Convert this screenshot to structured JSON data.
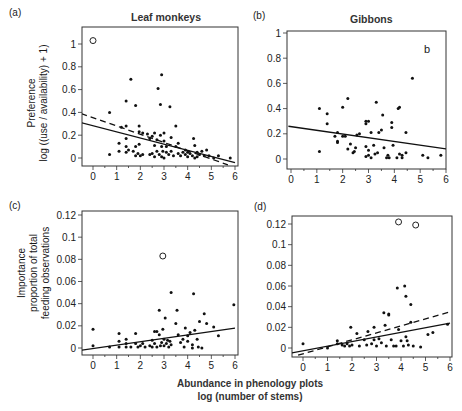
{
  "figure": {
    "shared_xlabel_line1": "Abundance in phenology plots",
    "shared_xlabel_line2": "log (number of stems)",
    "ylabel_top_line1": "Preference",
    "ylabel_top_line2": "log ((use / availability) + 1)",
    "ylabel_bottom_line1": "Importance",
    "ylabel_bottom_line2": "proportion of total",
    "ylabel_bottom_line3": "feeding observations"
  },
  "panels": [
    {
      "letter": "(a)",
      "title": "Leaf monkeys"
    },
    {
      "letter": "(b)",
      "title": "Gibbons",
      "annotation": "b"
    },
    {
      "letter": "(c)",
      "title": ""
    },
    {
      "letter": "(d)",
      "title": ""
    }
  ],
  "chart_data": [
    {
      "id": "a",
      "type": "scatter",
      "title": "Leaf monkeys",
      "panel_label": "(a)",
      "xlabel": "",
      "ylabel": "Preference log ((use / availability) + 1)",
      "xlim": [
        -0.5,
        6
      ],
      "ylim": [
        -0.06,
        1.1
      ],
      "xticks": [
        0,
        1,
        2,
        3,
        4,
        5,
        6
      ],
      "yticks": [
        0,
        0.2,
        0.4,
        0.6,
        0.8,
        1
      ],
      "ytick_labels": [
        "0",
        "0.2",
        "0.4",
        "0.6",
        "0.8",
        "1"
      ],
      "grid": false,
      "frame": {
        "left": 82,
        "top": 27,
        "right": 238,
        "bottom": 166,
        "x0px": 93,
        "x6px": 235,
        "y0px": 158,
        "yTopVal": 1,
        "yTopPx": 44
      },
      "outliers": [
        [
          0,
          1.03
        ]
      ],
      "points": [
        [
          0.7,
          0.4
        ],
        [
          0.7,
          0.03
        ],
        [
          1.1,
          0.06
        ],
        [
          1.1,
          0.13
        ],
        [
          1.2,
          0.27
        ],
        [
          1.4,
          0.5
        ],
        [
          1.4,
          0.28
        ],
        [
          1.4,
          0.17
        ],
        [
          1.4,
          0.1
        ],
        [
          1.4,
          0.05
        ],
        [
          1.6,
          0.69
        ],
        [
          1.5,
          0.07
        ],
        [
          1.7,
          0.06
        ],
        [
          1.8,
          0.46
        ],
        [
          1.8,
          0.1
        ],
        [
          1.8,
          0.02
        ],
        [
          1.9,
          0.04
        ],
        [
          1.95,
          0.28
        ],
        [
          1.95,
          0.23
        ],
        [
          1.95,
          0.12
        ],
        [
          2.0,
          0.02
        ],
        [
          2.1,
          0.22
        ],
        [
          2.1,
          0.03
        ],
        [
          2.3,
          0.21
        ],
        [
          2.4,
          0.17
        ],
        [
          2.4,
          0.03
        ],
        [
          2.5,
          0.19
        ],
        [
          2.5,
          0.04
        ],
        [
          2.6,
          0.22
        ],
        [
          2.6,
          0.11
        ],
        [
          2.6,
          0.01
        ],
        [
          2.7,
          0.16
        ],
        [
          2.7,
          0.06
        ],
        [
          2.75,
          0.61
        ],
        [
          2.8,
          0.03
        ],
        [
          2.85,
          0.47
        ],
        [
          2.85,
          0.2
        ],
        [
          2.9,
          0.73
        ],
        [
          2.9,
          0.1
        ],
        [
          2.9,
          0.01
        ],
        [
          2.95,
          0.06
        ],
        [
          3.0,
          0.15
        ],
        [
          3.0,
          0.22
        ],
        [
          3.0,
          0.0
        ],
        [
          3.1,
          0.05
        ],
        [
          3.1,
          0.1
        ],
        [
          3.2,
          0.03
        ],
        [
          3.25,
          0.45
        ],
        [
          3.3,
          0.18
        ],
        [
          3.3,
          0.06
        ],
        [
          3.4,
          0.02
        ],
        [
          3.5,
          0.1
        ],
        [
          3.5,
          0.28
        ],
        [
          3.6,
          0.04
        ],
        [
          3.6,
          0.13
        ],
        [
          3.7,
          0.02
        ],
        [
          3.8,
          0.05
        ],
        [
          3.9,
          0.03
        ],
        [
          3.9,
          0.07
        ],
        [
          4.0,
          0.01
        ],
        [
          4.0,
          0.05
        ],
        [
          4.1,
          0.04
        ],
        [
          4.2,
          0.02
        ],
        [
          4.25,
          0.17
        ],
        [
          4.3,
          0.11
        ],
        [
          4.3,
          0.0
        ],
        [
          4.4,
          0.05
        ],
        [
          4.4,
          0.01
        ],
        [
          4.5,
          0.03
        ],
        [
          4.6,
          0.06
        ],
        [
          4.7,
          0.02
        ],
        [
          4.8,
          0.07
        ],
        [
          4.9,
          0.02
        ],
        [
          5.1,
          0.0
        ],
        [
          5.3,
          0.02
        ],
        [
          5.8,
          0.0
        ]
      ],
      "series": [
        {
          "name": "fit (all data)",
          "style": "solid",
          "x": [
            -0.5,
            6
          ],
          "y": [
            0.31,
            -0.04
          ]
        },
        {
          "name": "fit (outlier excluded)",
          "style": "dashed",
          "x": [
            -0.5,
            5.7
          ],
          "y": [
            0.39,
            -0.06
          ]
        }
      ]
    },
    {
      "id": "b",
      "type": "scatter",
      "title": "Gibbons",
      "panel_label": "(b)",
      "annotation": "b",
      "xlabel": "",
      "ylabel": "",
      "xlim": [
        -0.1,
        6
      ],
      "ylim": [
        -0.06,
        1.02
      ],
      "xticks": [
        0,
        1,
        2,
        3,
        4,
        5,
        6
      ],
      "yticks": [
        0,
        0.2,
        0.4,
        0.6,
        0.8,
        1
      ],
      "ytick_labels": [
        "0",
        "0.2",
        "0.4",
        "0.6",
        "0.8",
        "1"
      ],
      "grid": false,
      "frame": {
        "left": 287,
        "top": 31,
        "right": 446,
        "bottom": 169,
        "x0px": 291,
        "x6px": 446,
        "y0px": 159,
        "yTopVal": 1,
        "yTopPx": 33
      },
      "outliers": [],
      "points": [
        [
          1.1,
          0.4
        ],
        [
          1.1,
          0.06
        ],
        [
          1.4,
          0.36
        ],
        [
          1.4,
          0.28
        ],
        [
          1.7,
          0.18
        ],
        [
          1.8,
          0.21
        ],
        [
          1.8,
          0.14
        ],
        [
          1.8,
          0.13
        ],
        [
          2.0,
          0.41
        ],
        [
          2.0,
          0.18
        ],
        [
          2.1,
          0.18
        ],
        [
          2.2,
          0.48
        ],
        [
          2.2,
          0.08
        ],
        [
          2.3,
          0.12
        ],
        [
          2.4,
          0.05
        ],
        [
          2.45,
          0.06
        ],
        [
          2.5,
          0.09
        ],
        [
          2.55,
          0.19
        ],
        [
          2.65,
          0.2
        ],
        [
          2.9,
          0.28
        ],
        [
          2.9,
          0.3
        ],
        [
          2.9,
          0.1
        ],
        [
          2.9,
          0.02
        ],
        [
          3.0,
          0.3
        ],
        [
          3.0,
          0.07
        ],
        [
          3.0,
          0.03
        ],
        [
          3.1,
          0.21
        ],
        [
          3.1,
          0.01
        ],
        [
          3.2,
          0.11
        ],
        [
          3.25,
          0.04
        ],
        [
          3.3,
          0.45
        ],
        [
          3.35,
          0.05
        ],
        [
          3.4,
          0.21
        ],
        [
          3.5,
          0.23
        ],
        [
          3.55,
          0.35
        ],
        [
          3.6,
          0.09
        ],
        [
          3.7,
          0.01
        ],
        [
          3.75,
          0.03
        ],
        [
          3.8,
          0.01
        ],
        [
          3.9,
          0.29
        ],
        [
          3.9,
          0.25
        ],
        [
          3.95,
          0.11
        ],
        [
          4.1,
          0.01
        ],
        [
          4.15,
          0.4
        ],
        [
          4.2,
          0.41
        ],
        [
          4.2,
          0.04
        ],
        [
          4.3,
          0.01
        ],
        [
          4.3,
          0.03
        ],
        [
          4.45,
          0.21
        ],
        [
          4.45,
          0.05
        ],
        [
          4.7,
          0.64
        ],
        [
          5.1,
          0.03
        ],
        [
          5.3,
          0.01
        ],
        [
          5.8,
          0.03
        ]
      ],
      "series": [
        {
          "name": "fit",
          "style": "solid",
          "x": [
            -0.1,
            6
          ],
          "y": [
            0.26,
            0.08
          ]
        }
      ]
    },
    {
      "id": "c",
      "type": "scatter",
      "title": "",
      "panel_label": "(c)",
      "xlabel": "Abundance in phenology plots log (number of stems)",
      "ylabel": "Importance proportion of total feeding observations",
      "xlim": [
        -0.5,
        6
      ],
      "ylim": [
        -0.006,
        0.124
      ],
      "xticks": [
        0,
        1,
        2,
        3,
        4,
        5,
        6
      ],
      "yticks": [
        0,
        0.02,
        0.04,
        0.06,
        0.08,
        0.1,
        0.12
      ],
      "ytick_labels": [
        "0",
        "0.02",
        "0.04",
        "0.06",
        "0.08",
        "0.1",
        "0.12"
      ],
      "grid": false,
      "frame": {
        "left": 82,
        "top": 211,
        "right": 238,
        "bottom": 355,
        "x0px": 93,
        "x6px": 235,
        "y0px": 348,
        "yTopVal": 0.12,
        "yTopPx": 215
      },
      "outliers": [
        [
          2.95,
          0.083
        ]
      ],
      "points": [
        [
          0,
          0.017
        ],
        [
          0,
          0.002
        ],
        [
          0.7,
          0.001
        ],
        [
          1.1,
          0.013
        ],
        [
          1.1,
          0.006
        ],
        [
          1.1,
          0.001
        ],
        [
          1.4,
          0.008
        ],
        [
          1.4,
          0.004
        ],
        [
          1.4,
          0.001
        ],
        [
          1.6,
          0.001
        ],
        [
          1.8,
          0.013
        ],
        [
          1.8,
          0.004
        ],
        [
          1.9,
          0.001
        ],
        [
          2.0,
          0.002
        ],
        [
          2.1,
          0.004
        ],
        [
          2.2,
          0.001
        ],
        [
          2.4,
          0.002
        ],
        [
          2.5,
          0.007
        ],
        [
          2.5,
          0.001
        ],
        [
          2.6,
          0.015
        ],
        [
          2.6,
          0.004
        ],
        [
          2.7,
          0.015
        ],
        [
          2.7,
          0.001
        ],
        [
          2.8,
          0.034
        ],
        [
          2.8,
          0.012
        ],
        [
          2.85,
          0.002
        ],
        [
          2.9,
          0.005
        ],
        [
          2.95,
          0.017
        ],
        [
          3.0,
          0.008
        ],
        [
          3.0,
          0.002
        ],
        [
          3.05,
          0.027
        ],
        [
          3.1,
          0.004
        ],
        [
          3.15,
          0.007
        ],
        [
          3.2,
          0.001
        ],
        [
          3.25,
          0.006
        ],
        [
          3.3,
          0.05
        ],
        [
          3.3,
          0.003
        ],
        [
          3.5,
          0.022
        ],
        [
          3.55,
          0.034
        ],
        [
          3.6,
          0.012
        ],
        [
          3.7,
          0.005
        ],
        [
          3.8,
          0.008
        ],
        [
          3.85,
          0.001
        ],
        [
          3.9,
          0.018
        ],
        [
          4.0,
          0.006
        ],
        [
          4.0,
          0.011
        ],
        [
          4.1,
          0.014
        ],
        [
          4.2,
          0.003
        ],
        [
          4.2,
          0.0
        ],
        [
          4.25,
          0.049
        ],
        [
          4.3,
          0.016
        ],
        [
          4.4,
          0.008
        ],
        [
          4.45,
          0.001
        ],
        [
          4.5,
          0.024
        ],
        [
          4.6,
          0.0
        ],
        [
          4.7,
          0.031
        ],
        [
          4.8,
          0.022
        ],
        [
          5.1,
          0.019
        ],
        [
          5.3,
          0.011
        ],
        [
          5.95,
          0.039
        ]
      ],
      "series": [
        {
          "name": "fit",
          "style": "solid",
          "x": [
            -0.5,
            6
          ],
          "y": [
            -0.002,
            0.018
          ]
        }
      ]
    },
    {
      "id": "d",
      "type": "scatter",
      "title": "",
      "panel_label": "(d)",
      "xlabel": "Abundance in phenology plots log (number of stems)",
      "ylabel": "",
      "xlim": [
        -0.5,
        6
      ],
      "ylim": [
        -0.008,
        0.128
      ],
      "xticks": [
        0,
        1,
        2,
        3,
        4,
        5,
        6
      ],
      "yticks": [
        0,
        0.02,
        0.04,
        0.06,
        0.08,
        0.1,
        0.12
      ],
      "ytick_labels": [
        "0",
        "0.02",
        "0.04",
        "0.06",
        "0.08",
        "0.1",
        "0.12"
      ],
      "grid": false,
      "frame": {
        "left": 292,
        "top": 216,
        "right": 452,
        "bottom": 357,
        "x0px": 303,
        "x6px": 450,
        "y0px": 348,
        "yTopVal": 0.12,
        "yTopPx": 224
      },
      "outliers": [
        [
          3.9,
          0.122
        ],
        [
          4.6,
          0.119
        ]
      ],
      "points": [
        [
          0,
          0.004
        ],
        [
          1.0,
          0.0
        ],
        [
          1.4,
          0.007
        ],
        [
          1.4,
          0.004
        ],
        [
          1.6,
          0.003
        ],
        [
          1.7,
          0.002
        ],
        [
          1.8,
          0.004
        ],
        [
          1.9,
          0.002
        ],
        [
          1.95,
          0.02
        ],
        [
          2.0,
          0.003
        ],
        [
          2.2,
          0.014
        ],
        [
          2.3,
          0.002
        ],
        [
          2.5,
          0.008
        ],
        [
          2.6,
          0.003
        ],
        [
          2.65,
          0.016
        ],
        [
          2.8,
          0.004
        ],
        [
          2.9,
          0.02
        ],
        [
          2.9,
          0.008
        ],
        [
          3.0,
          0.002
        ],
        [
          3.1,
          0.009
        ],
        [
          3.2,
          0.005
        ],
        [
          3.3,
          0.034
        ],
        [
          3.35,
          0.022
        ],
        [
          3.4,
          0.002
        ],
        [
          3.5,
          0.033
        ],
        [
          3.5,
          0.032
        ],
        [
          3.6,
          0.008
        ],
        [
          3.7,
          0.002
        ],
        [
          3.8,
          0.002
        ],
        [
          3.85,
          0.058
        ],
        [
          3.9,
          0.018
        ],
        [
          4.0,
          0.007
        ],
        [
          4.1,
          0.002
        ],
        [
          4.15,
          0.06
        ],
        [
          4.2,
          0.05
        ],
        [
          4.2,
          0.011
        ],
        [
          4.25,
          0.007
        ],
        [
          4.3,
          0.003
        ],
        [
          4.4,
          0.042
        ],
        [
          4.4,
          0.025
        ],
        [
          4.5,
          0.002
        ],
        [
          4.8,
          0.001
        ],
        [
          5.1,
          0.013
        ],
        [
          5.3,
          0.015
        ],
        [
          5.9,
          0.023
        ]
      ],
      "series": [
        {
          "name": "fit (all data)",
          "style": "solid",
          "x": [
            -0.5,
            6
          ],
          "y": [
            -0.005,
            0.024
          ]
        },
        {
          "name": "fit (outliers excluded)",
          "style": "dashed",
          "x": [
            -0.2,
            6
          ],
          "y": [
            -0.007,
            0.035
          ]
        }
      ]
    }
  ]
}
